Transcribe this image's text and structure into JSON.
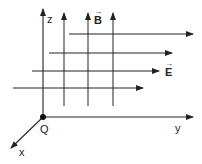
{
  "diagram": {
    "type": "3d-coordinate-field-diagram",
    "colors": {
      "line": "#222222",
      "background": "#ffffff"
    },
    "axes": {
      "z": {
        "label": "z"
      },
      "y": {
        "label": "y"
      },
      "x": {
        "label": "x"
      }
    },
    "origin": {
      "label": "Q"
    },
    "fields": {
      "magnetic": {
        "label": "B",
        "vector_arrow": "→",
        "direction": "+z",
        "line_count": 3
      },
      "electric": {
        "label": "E",
        "vector_arrow": "→",
        "direction": "+y",
        "line_count": 4
      }
    }
  }
}
